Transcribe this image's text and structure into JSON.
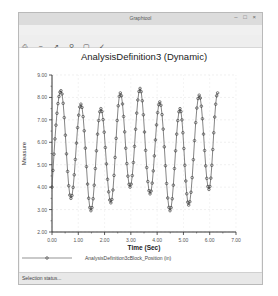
{
  "window": {
    "title": "Graphtool",
    "controls": "– □ ×"
  },
  "menubar": {
    "items": [
      {
        "label": "File"
      },
      {
        "label": "View"
      },
      {
        "label": "Format"
      }
    ]
  },
  "toolbar": {
    "icons": [
      "print-icon",
      "zoom-out-icon",
      "pan-icon",
      "zoom-in-icon",
      "zoom-box-icon",
      "check-icon"
    ]
  },
  "statusbar": {
    "text": "Selection status..."
  },
  "chart_data": {
    "type": "line",
    "title": "AnalysisDefinition3 (Dynamic)",
    "xlabel": "Time (Sec)",
    "ylabel": "Measure",
    "xlim": [
      0,
      7
    ],
    "ylim": [
      2,
      9
    ],
    "xticks": [
      "0.00",
      "1.00",
      "2.00",
      "3.00",
      "4.00",
      "5.00",
      "6.00",
      "7.00"
    ],
    "yticks": [
      "2.00",
      "3.00",
      "4.00",
      "5.00",
      "6.00",
      "7.00",
      "8.00",
      "9.00"
    ],
    "grid": true,
    "legend_position": "bottom",
    "series": [
      {
        "name": "AnalysisDefinition3cBlock_Position (in)",
        "color": "#444444",
        "marker": "circle",
        "x": [
          0.0,
          0.34,
          0.72,
          1.1,
          1.48,
          1.86,
          2.24,
          2.6,
          2.97,
          3.35,
          3.73,
          4.1,
          4.49,
          4.87,
          5.2,
          5.6,
          5.97,
          6.3
        ],
        "y": [
          4.0,
          8.3,
          3.5,
          7.7,
          2.95,
          7.5,
          3.3,
          8.2,
          4.0,
          8.4,
          3.7,
          7.8,
          2.95,
          7.5,
          3.2,
          8.1,
          3.9,
          8.2
        ]
      }
    ]
  }
}
